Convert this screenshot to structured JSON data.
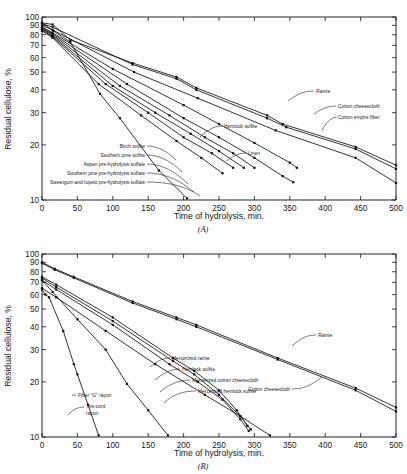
{
  "figure": {
    "background": "#fdfdfd",
    "ink": "#111111"
  },
  "panels": [
    {
      "id": "A",
      "caption": "(A)",
      "xlabel": "Time of hydrolysis, min.",
      "ylabel": "Residual cellulose, %"
    },
    {
      "id": "B",
      "caption": "(B)",
      "xlabel": "Time of hydrolysis, min.",
      "ylabel": "Residual cellulose, %"
    }
  ],
  "axes": {
    "x_ticks": [
      "0",
      "50",
      "100",
      "150",
      "200",
      "250",
      "300",
      "350",
      "400",
      "450",
      "500"
    ],
    "y_ticks": [
      "100",
      "90",
      "80",
      "70",
      "60",
      "50",
      "40",
      "30",
      "20",
      "10"
    ]
  },
  "chart_data": [
    {
      "type": "line",
      "panel": "A",
      "title": "(A)",
      "xlabel": "Time of hydrolysis, min.",
      "ylabel": "Residual cellulose, %",
      "xlim": [
        0,
        500
      ],
      "ylim": [
        10,
        100
      ],
      "yscale": "log",
      "grid": false,
      "legend_position": "inline-annotations",
      "series": [
        {
          "name": "Ramie",
          "label": "Ramie",
          "points": [
            [
              0,
              93
            ],
            [
              15,
              91
            ],
            [
              40,
              75
            ],
            [
              128,
              56
            ],
            [
              190,
              47
            ],
            [
              218,
              41
            ],
            [
              318,
              29
            ],
            [
              340,
              26
            ],
            [
              443,
              19.5
            ],
            [
              500,
              15.5
            ]
          ]
        },
        {
          "name": "Cotton cheesecloth",
          "label": "Cotton cheesecloth",
          "points": [
            [
              0,
              92
            ],
            [
              15,
              88
            ],
            [
              128,
              55
            ],
            [
              190,
              46
            ],
            [
              218,
              40
            ],
            [
              318,
              28
            ],
            [
              345,
              25
            ],
            [
              443,
              19
            ],
            [
              500,
              14.8
            ]
          ]
        },
        {
          "name": "Cotton empire fiber",
          "label": "Cotton empire fiber",
          "points": [
            [
              0,
              90
            ],
            [
              15,
              85
            ],
            [
              130,
              50
            ],
            [
              220,
              36
            ],
            [
              330,
              24
            ],
            [
              443,
              17
            ],
            [
              500,
              12.4
            ]
          ]
        },
        {
          "name": "Linen",
          "label": "Linen",
          "points": [
            [
              0,
              88
            ],
            [
              15,
              82
            ],
            [
              100,
              52
            ],
            [
              200,
              33
            ],
            [
              250,
              26
            ],
            [
              300,
              20.5
            ],
            [
              350,
              16
            ],
            [
              360,
              15
            ]
          ]
        },
        {
          "name": "Hemlock sulfite",
          "label": "Hemlock sulfite",
          "points": [
            [
              0,
              88
            ],
            [
              15,
              81
            ],
            [
              120,
              43
            ],
            [
              200,
              28
            ],
            [
              250,
              22
            ],
            [
              300,
              17
            ],
            [
              340,
              13.5
            ],
            [
              355,
              12.5
            ]
          ]
        },
        {
          "name": "Birch sulfite",
          "label": "Birch sulfite",
          "points": [
            [
              0,
              87
            ],
            [
              15,
              80
            ],
            [
              110,
              42
            ],
            [
              180,
              29
            ],
            [
              230,
              22
            ],
            [
              270,
              18
            ],
            [
              300,
              15
            ]
          ]
        },
        {
          "name": "Southern pine sulfite",
          "label": "Southern pine sulfite",
          "points": [
            [
              0,
              86
            ],
            [
              15,
              79
            ],
            [
              100,
              42
            ],
            [
              160,
              30
            ],
            [
              210,
              23
            ],
            [
              250,
              18.5
            ],
            [
              285,
              15
            ]
          ]
        },
        {
          "name": "Aspen pre-hydrolysis sulfate",
          "label": "Aspen pre-hydrolysis sulfate",
          "points": [
            [
              0,
              85
            ],
            [
              15,
              78
            ],
            [
              90,
              43
            ],
            [
              150,
              30
            ],
            [
              200,
              22
            ],
            [
              240,
              18
            ],
            [
              270,
              15
            ]
          ]
        },
        {
          "name": "Southern pine pre-hydrolysis sulfate",
          "label": "Southern pine pre-hydrolysis sulfate",
          "points": [
            [
              0,
              84
            ],
            [
              15,
              77
            ],
            [
              80,
              43
            ],
            [
              140,
              29
            ],
            [
              190,
              21
            ],
            [
              225,
              17
            ],
            [
              255,
              14
            ]
          ]
        },
        {
          "name": "Sweetgum and tupelo pre-hydrolysis sulfate",
          "label": "Sweetgum and tupelo pre-hydrolysis sulfate",
          "points": [
            [
              0,
              93
            ],
            [
              16,
              84
            ],
            [
              40,
              73
            ],
            [
              82,
              38
            ],
            [
              110,
              28
            ],
            [
              165,
              14.5
            ],
            [
              205,
              10.2
            ]
          ]
        }
      ]
    },
    {
      "type": "line",
      "panel": "B",
      "title": "(B)",
      "xlabel": "Time of hydrolysis, min.",
      "ylabel": "Residual cellulose, %",
      "xlim": [
        0,
        500
      ],
      "ylim": [
        10,
        100
      ],
      "yscale": "log",
      "grid": false,
      "legend_position": "inline-annotations",
      "series": [
        {
          "name": "Ramie",
          "label": "Ramie",
          "points": [
            [
              0,
              90
            ],
            [
              18,
              83
            ],
            [
              45,
              75
            ],
            [
              128,
              55
            ],
            [
              190,
              45
            ],
            [
              218,
              41
            ],
            [
              333,
              27
            ],
            [
              443,
              18.5
            ],
            [
              500,
              14.5
            ]
          ]
        },
        {
          "name": "Cotton cheesecloth",
          "label": "Cotton cheesecloth",
          "points": [
            [
              0,
              89
            ],
            [
              18,
              82
            ],
            [
              45,
              74
            ],
            [
              128,
              54
            ],
            [
              190,
              44
            ],
            [
              218,
              40
            ],
            [
              333,
              26.5
            ],
            [
              443,
              18
            ],
            [
              500,
              13.8
            ]
          ]
        },
        {
          "name": "Mercerized ramie",
          "label": "Mercerized ramie",
          "points": [
            [
              0,
              75
            ],
            [
              20,
              68
            ],
            [
              100,
              45
            ],
            [
              185,
              27
            ],
            [
              215,
              23
            ],
            [
              250,
              18
            ],
            [
              275,
              14
            ],
            [
              290,
              11.5
            ]
          ]
        },
        {
          "name": "Hemlock sulfite",
          "label": "Hemlock sulfite",
          "points": [
            [
              0,
              74
            ],
            [
              20,
              66
            ],
            [
              100,
              43
            ],
            [
              185,
              26
            ],
            [
              215,
              22
            ],
            [
              250,
              17
            ],
            [
              280,
              13
            ],
            [
              295,
              11
            ]
          ]
        },
        {
          "name": "Mercerized cotton cheesecloth",
          "label": "Mercerized cotton cheesecloth",
          "points": [
            [
              0,
              72
            ],
            [
              20,
              64
            ],
            [
              100,
              41
            ],
            [
              180,
              25
            ],
            [
              220,
              20
            ],
            [
              255,
              16
            ],
            [
              280,
              12.5
            ],
            [
              292,
              10.8
            ]
          ]
        },
        {
          "name": "Mercerized hemlock sulfite",
          "label": "Mercerized hemlock sulfite",
          "points": [
            [
              0,
              65
            ],
            [
              20,
              58
            ],
            [
              90,
              38
            ],
            [
              160,
              25
            ],
            [
              230,
              17
            ],
            [
              280,
              13
            ],
            [
              322,
              10.2
            ]
          ]
        },
        {
          "name": "Fiber \"G\" rayon",
          "label": "Fiber \"G\" rayon",
          "points": [
            [
              0,
              72
            ],
            [
              15,
              62
            ],
            [
              50,
              44
            ],
            [
              90,
              30
            ],
            [
              120,
              19.5
            ],
            [
              150,
              14
            ],
            [
              178,
              10.2
            ]
          ]
        },
        {
          "name": "Tire-cord rayon",
          "label": "Tire-cord rayon",
          "points": [
            [
              0,
              64
            ],
            [
              5,
              60
            ],
            [
              10,
              58
            ],
            [
              30,
              38
            ],
            [
              45,
              25
            ],
            [
              50,
              22
            ],
            [
              65,
              15
            ],
            [
              80,
              10.2
            ]
          ]
        }
      ]
    }
  ],
  "annotations": {
    "panel_a": [
      {
        "name": "ramie",
        "text": "Ramie"
      },
      {
        "name": "cotton-cheesecloth",
        "text": "Cotton cheesecloth"
      },
      {
        "name": "cotton-empire-fiber",
        "text": "Cotton empire fiber"
      },
      {
        "name": "hemlock-sulfite",
        "text": "Hemlock sulfite"
      },
      {
        "name": "linen",
        "text": "Linen"
      },
      {
        "name": "birch-sulfite",
        "text": "Birch sulfite"
      },
      {
        "name": "southern-pine-sulfite",
        "text": "Southern pine sulfite"
      },
      {
        "name": "aspen-pre-hydrolysis-sulfate",
        "text": "Aspen pre-hydrolysis sulfate"
      },
      {
        "name": "southern-pine-pre-hydrolysis-sulfate",
        "text": "Southern pine pre-hydrolysis sulfate"
      },
      {
        "name": "sweetgum-tupelo-pre-hydrolysis-sulfate",
        "text": "Sweetgum and tupelo pre-hydrolysis sulfate"
      }
    ],
    "panel_b": [
      {
        "name": "ramie",
        "text": "Ramie"
      },
      {
        "name": "cotton-cheesecloth",
        "text": "Cotton cheesecloth"
      },
      {
        "name": "mercerized-ramie",
        "text": "Mercerized ramie"
      },
      {
        "name": "hemlock-sulfite",
        "text": "Hemlock sulfite"
      },
      {
        "name": "mercerized-cotton-cheesecloth",
        "text": "Mercerized cotton cheesecloth"
      },
      {
        "name": "mercerized-hemlock-sulfite",
        "text": "Mercerized hemlock sulfite"
      },
      {
        "name": "fiber-g-rayon",
        "text": "Fiber \"G\" rayon"
      },
      {
        "name": "tire-cord-rayon-line1",
        "text": "Tire-cord"
      },
      {
        "name": "tire-cord-rayon-line2",
        "text": "rayon"
      }
    ]
  }
}
